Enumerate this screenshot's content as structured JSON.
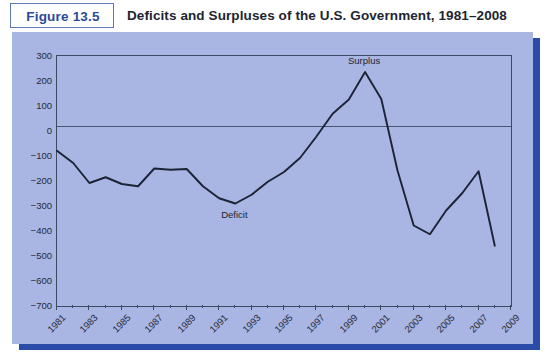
{
  "header": {
    "figure_label": "Figure 13.5",
    "title": "Deficits and Surpluses of the U.S. Government, 1981–2008"
  },
  "colors": {
    "panel_background": "#a9b5e2",
    "panel_shadow": "#2b4ba8",
    "figure_label_text": "#2a4a9c",
    "figure_box_border": "#5f77bb",
    "series_line": "#1b2335",
    "axis": "#3d4a66",
    "zero_line": "#4a5570",
    "page_background": "#ffffff"
  },
  "chart_data": {
    "type": "line",
    "title": "Deficits and Surpluses of the U.S. Government, 1981–2008",
    "xlabel": "",
    "ylabel": "",
    "xlim": [
      1981,
      2009
    ],
    "ylim": [
      -700,
      300
    ],
    "ytick_step": 100,
    "yticks": [
      300,
      200,
      100,
      0,
      -100,
      -200,
      -300,
      -400,
      -500,
      -600,
      -700
    ],
    "ytick_labels": [
      "300",
      "200",
      "100",
      "0",
      "−100",
      "−200",
      "−300",
      "−400",
      "−500",
      "−600",
      "−700"
    ],
    "xticks_major": [
      1981,
      1983,
      1985,
      1987,
      1989,
      1991,
      1993,
      1995,
      1997,
      1999,
      2001,
      2003,
      2005,
      2007,
      2009
    ],
    "xtick_labels": [
      "1981",
      "1983",
      "1985",
      "1987",
      "1989",
      "1991",
      "1993",
      "1995",
      "1997",
      "1999",
      "2001",
      "2003",
      "2005",
      "2007",
      "2009"
    ],
    "xticks_minor": [
      1982,
      1984,
      1986,
      1988,
      1990,
      1992,
      1994,
      1996,
      1998,
      2000,
      2002,
      2004,
      2006,
      2008
    ],
    "grid": false,
    "legend": false,
    "zero_reference_line": 0,
    "x": [
      1981,
      1982,
      1983,
      1984,
      1985,
      1986,
      1987,
      1988,
      1989,
      1990,
      1991,
      1992,
      1993,
      1994,
      1995,
      1996,
      1997,
      1998,
      1999,
      2000,
      2001,
      2002,
      2003,
      2004,
      2005,
      2006,
      2007,
      2008
    ],
    "series": [
      {
        "name": "Federal budget deficit/surplus",
        "values": [
          -79,
          -128,
          -208,
          -185,
          -212,
          -221,
          -150,
          -155,
          -152,
          -221,
          -269,
          -290,
          -255,
          -203,
          -164,
          -107,
          -22,
          69,
          126,
          236,
          128,
          -158,
          -378,
          -413,
          -318,
          -248,
          -161,
          -459
        ]
      }
    ],
    "annotations": [
      {
        "text": "Deficit",
        "x": 1992,
        "y": -290,
        "position": "below"
      },
      {
        "text": "Surplus",
        "x": 2000,
        "y": 236,
        "position": "above"
      }
    ]
  }
}
